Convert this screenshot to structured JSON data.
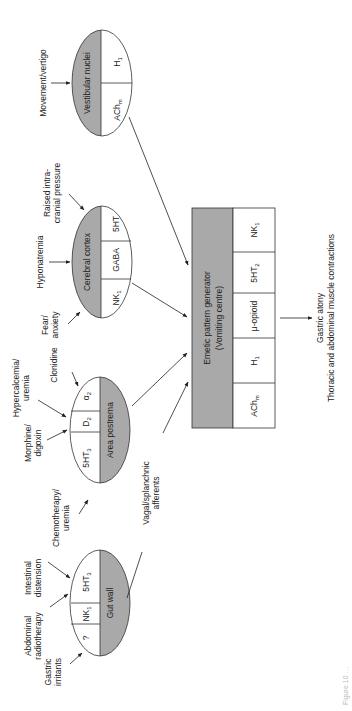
{
  "figure": {
    "orientation": "rotated-90-ccw",
    "caption_partial": "Figure 10 …",
    "colors": {
      "shaded": "#a9a9a9",
      "line": "#333333",
      "background": "#ffffff"
    }
  },
  "nodes": {
    "vestibular": {
      "title": "Vestibular nuclei",
      "receptors": [
        "ACh",
        "H"
      ],
      "receptor_subs": [
        "m",
        "1"
      ],
      "stimuli": [
        "Movement/vertigo"
      ]
    },
    "cerebral": {
      "title": "Cerebral cortex",
      "receptors": [
        "NK",
        "GABA",
        "5HT"
      ],
      "receptor_subs": [
        "1",
        "",
        ""
      ],
      "stimuli": [
        "Fear/",
        "anxiety",
        "Hyponatremia",
        "Raised intra-",
        "cranial pressure"
      ]
    },
    "area_postrema": {
      "title": "Area postrema",
      "receptors": [
        "5HT",
        "D",
        "α"
      ],
      "receptor_subs": [
        "3",
        "2",
        "2"
      ],
      "stimuli": [
        "Chemotherapy/",
        "uremia",
        "Morphine/",
        "digoxin",
        "Hypercalcemia/",
        "uremia",
        "Clonidine"
      ]
    },
    "gut_wall": {
      "title": "Gut wall",
      "receptors": [
        "?",
        "NK",
        "5HT"
      ],
      "receptor_subs": [
        "",
        "1",
        "3"
      ],
      "stimuli": [
        "Gastric",
        "irritants",
        "Abdominal",
        "radiotherapy",
        "Intestinal",
        "distension"
      ]
    },
    "emetic": {
      "title_line1": "Emetic pattern generator",
      "title_line2": "(Vomiting centre)",
      "receptors": [
        "ACh",
        "H",
        "μ-opioid",
        "5HT",
        "NK"
      ],
      "receptor_subs": [
        "m",
        "1",
        "",
        "2",
        "1"
      ]
    }
  },
  "edges": {
    "vagal_line1": "Vagal/splanchnic",
    "vagal_line2": "afferents"
  },
  "output": {
    "line1": "Gastric atony",
    "line2": "Thoracic and abdominal muscle contractions"
  }
}
